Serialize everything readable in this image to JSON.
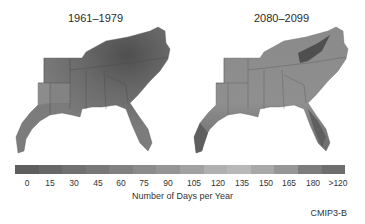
{
  "panels": [
    {
      "title": "1961–1979",
      "base": "#6f6f6f",
      "dark": "#505050",
      "light": "#8c8c8c"
    },
    {
      "title": "2080–2099",
      "base": "#8e8e8e",
      "dark": "#5a5a5a",
      "light": "#a4a4a4"
    }
  ],
  "colorbar": {
    "colors": [
      "#5e5e5e",
      "#676767",
      "#707070",
      "#787878",
      "#818181",
      "#8b8b8b",
      "#959595",
      "#a1a1a1",
      "#b0b0b0",
      "#b8b8b8",
      "#a8a8a8",
      "#969696",
      "#7c7c7c",
      "#6e6e6e"
    ],
    "ticks": [
      "0",
      "15",
      "30",
      "45",
      "60",
      "75",
      "90",
      "105",
      "120",
      "135",
      "150",
      "165",
      "180",
      ">120"
    ]
  },
  "xlabel": "Number of Days per Year",
  "source_label": "CMIP3-B"
}
